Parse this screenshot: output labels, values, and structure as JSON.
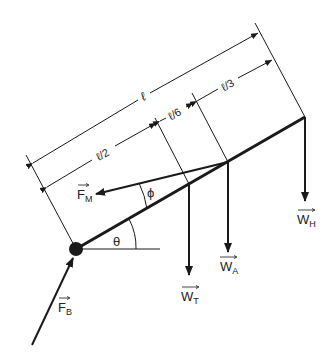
{
  "diagram": {
    "dimensions": {
      "total": "ℓ",
      "half": "ℓ/2",
      "sixth": "ℓ/6",
      "third": "ℓ/3"
    },
    "angles": {
      "theta": "θ",
      "phi": "ϕ"
    },
    "forces": {
      "fm": {
        "main": "F",
        "sub": "M"
      },
      "fb": {
        "main": "F",
        "sub": "B"
      },
      "wt": {
        "main": "W",
        "sub": "T"
      },
      "wa": {
        "main": "W",
        "sub": "A"
      },
      "wh": {
        "main": "W",
        "sub": "H"
      }
    },
    "colors": {
      "ink": "#1a1a1a",
      "background": "#ffffff"
    }
  }
}
